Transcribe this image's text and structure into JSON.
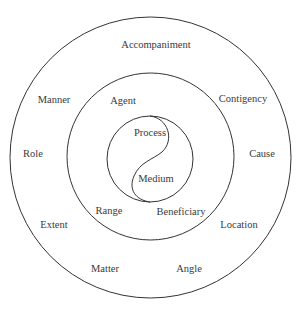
{
  "diagram": {
    "type": "concentric-circles",
    "core": {
      "labels": [
        "Process",
        "Medium"
      ]
    },
    "middle_ring": {
      "labels": [
        "Agent",
        "Range",
        "Beneficiary"
      ]
    },
    "outer_ring": {
      "labels": [
        "Accompaniment",
        "Manner",
        "Contigency",
        "Role",
        "Cause",
        "Extent",
        "Location",
        "Matter",
        "Angle"
      ]
    }
  }
}
